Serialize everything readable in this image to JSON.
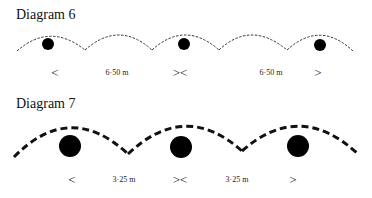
{
  "diagram6": {
    "title": "Diagram 6",
    "markers": [
      {
        "symbol": "<",
        "x": 55
      },
      {
        "symbol": "><",
        "x": 180
      },
      {
        "symbol": ">",
        "x": 318
      }
    ],
    "distances": [
      {
        "label": "6·50 m",
        "x": 117
      },
      {
        "label": "6·50 m",
        "x": 271
      }
    ],
    "dots": [
      {
        "cx": 48,
        "cy": 44,
        "r": 6
      },
      {
        "cx": 184,
        "cy": 44,
        "r": 6
      },
      {
        "cx": 320,
        "cy": 45,
        "r": 6
      }
    ]
  },
  "diagram7": {
    "title": "Diagram 7",
    "markers": [
      {
        "symbol": "<",
        "x": 72
      },
      {
        "symbol": "><",
        "x": 180
      },
      {
        "symbol": ">",
        "x": 293
      }
    ],
    "distances": [
      {
        "label": "3·25 m",
        "x": 124
      },
      {
        "label": "3·25 m",
        "x": 237
      }
    ],
    "dots": [
      {
        "cx": 70,
        "cy": 146,
        "r": 11
      },
      {
        "cx": 181,
        "cy": 147,
        "r": 11
      },
      {
        "cx": 298,
        "cy": 146,
        "r": 11
      }
    ]
  }
}
